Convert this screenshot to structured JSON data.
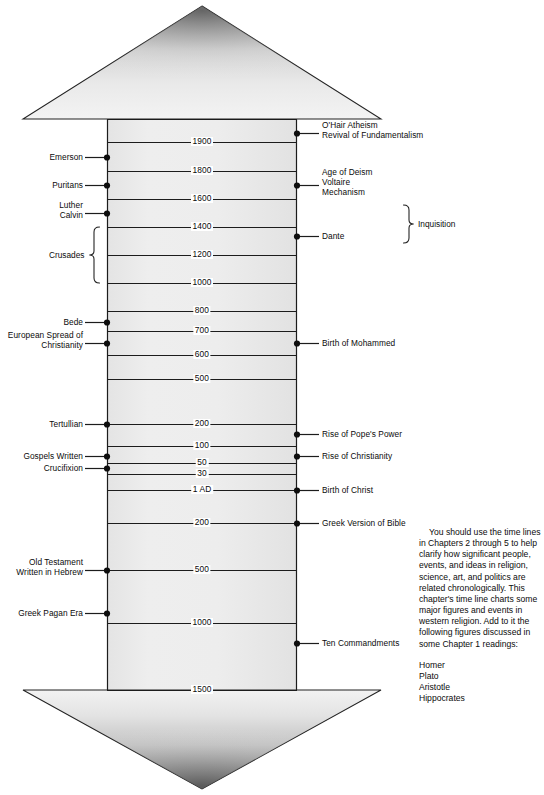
{
  "figure": {
    "geometry": {
      "column_left_x": 107,
      "column_right_x": 297,
      "column_top_y": 119,
      "column_bottom_y": 690,
      "arrow_top_apex_y": 6,
      "arrow_top_base_y": 119,
      "arrow_bottom_base_y": 690,
      "arrow_bottom_apex_y": 789,
      "arrow_left_x": 23,
      "arrow_right_x": 381
    },
    "shading": {
      "shaft_fill": "#ececec",
      "arrow_light": "#f2f2f2",
      "arrow_dark": "#6e6e6e",
      "stroke": "#1a1a1a"
    }
  },
  "ticks": [
    {
      "label": "1900",
      "y": 142
    },
    {
      "label": "1800",
      "y": 171
    },
    {
      "label": "1600",
      "y": 199
    },
    {
      "label": "1400",
      "y": 227
    },
    {
      "label": "1200",
      "y": 255
    },
    {
      "label": "1000",
      "y": 283
    },
    {
      "label": "800",
      "y": 311
    },
    {
      "label": "700",
      "y": 331
    },
    {
      "label": "600",
      "y": 355
    },
    {
      "label": "500",
      "y": 379
    },
    {
      "label": "200",
      "y": 424
    },
    {
      "label": "100",
      "y": 446
    },
    {
      "label": "50",
      "y": 463
    },
    {
      "label": "30",
      "y": 474
    },
    {
      "label": "1 AD",
      "y": 490
    },
    {
      "label": "200",
      "y": 523
    },
    {
      "label": "500",
      "y": 570
    },
    {
      "label": "1000",
      "y": 623
    },
    {
      "label": "1500",
      "y": 690
    }
  ],
  "left_events": [
    {
      "name": "emerson",
      "lines": [
        "Emerson"
      ],
      "y": 157,
      "leader": true
    },
    {
      "name": "puritans",
      "lines": [
        "Puritans"
      ],
      "y": 185,
      "leader": true
    },
    {
      "name": "luther-calvin",
      "lines": [
        "Luther",
        "Calvin"
      ],
      "y": 213,
      "leader": true
    },
    {
      "name": "bede",
      "lines": [
        "Bede"
      ],
      "y": 322,
      "leader": true
    },
    {
      "name": "european-spread",
      "lines": [
        "European Spread of",
        "Christianity"
      ],
      "y": 343,
      "leader": true
    },
    {
      "name": "tertullian",
      "lines": [
        "Tertullian"
      ],
      "y": 424,
      "leader": true
    },
    {
      "name": "gospels-written",
      "lines": [
        "Gospels Written"
      ],
      "y": 456,
      "leader": true
    },
    {
      "name": "crucifixion",
      "lines": [
        "Crucifixion"
      ],
      "y": 468,
      "leader": true
    },
    {
      "name": "old-testament",
      "lines": [
        "Old Testament",
        "Written in Hebrew"
      ],
      "y": 570,
      "leader": true
    },
    {
      "name": "greek-pagan-era",
      "lines": [
        "Greek Pagan Era"
      ],
      "y": 613,
      "leader": true
    }
  ],
  "right_events": [
    {
      "name": "ohair-atheism",
      "lines": [
        "O'Hair Atheism",
        "Revival of Fundamentalism"
      ],
      "y": 133,
      "leader": true
    },
    {
      "name": "age-of-deism",
      "lines": [
        "Age of Deism",
        "Voltaire",
        "Mechanism"
      ],
      "y": 185,
      "leader": true
    },
    {
      "name": "dante",
      "lines": [
        "Dante"
      ],
      "y": 236,
      "leader": true
    },
    {
      "name": "birth-of-mohammed",
      "lines": [
        "Birth of Mohammed"
      ],
      "y": 343,
      "leader": true
    },
    {
      "name": "rise-of-popes-power",
      "lines": [
        "Rise of Pope's Power"
      ],
      "y": 434,
      "leader": true
    },
    {
      "name": "rise-of-christianity",
      "lines": [
        "Rise of Christianity"
      ],
      "y": 456,
      "leader": true
    },
    {
      "name": "birth-of-christ",
      "lines": [
        "Birth of Christ"
      ],
      "y": 490,
      "leader": true
    },
    {
      "name": "greek-version-bible",
      "lines": [
        "Greek Version of Bible"
      ],
      "y": 523,
      "leader": true
    },
    {
      "name": "ten-commandments",
      "lines": [
        "Ten Commandments"
      ],
      "y": 643,
      "leader": true
    }
  ],
  "braces": [
    {
      "name": "crusades",
      "label": "Crusades",
      "side": "left",
      "y_top": 227,
      "y_bottom": 283,
      "label_x": 45,
      "brace_x": 94
    },
    {
      "name": "inquisition",
      "label": "Inquisition",
      "side": "right",
      "y_top": 205,
      "y_bottom": 243,
      "label_x": 418,
      "brace_x": 409
    }
  ],
  "note": {
    "paragraph": "You should use the time lines in Chapters 2 through 5 to help clarify how significant people, events, and ideas in religion, science, art, and politics are related chronologically. This chapter's time line charts some major figures and events in western religion. Add to it the following figures discussed in some Chapter 1 readings:",
    "figures": [
      "Homer",
      "Plato",
      "Aristotle",
      "Hippocrates"
    ]
  }
}
